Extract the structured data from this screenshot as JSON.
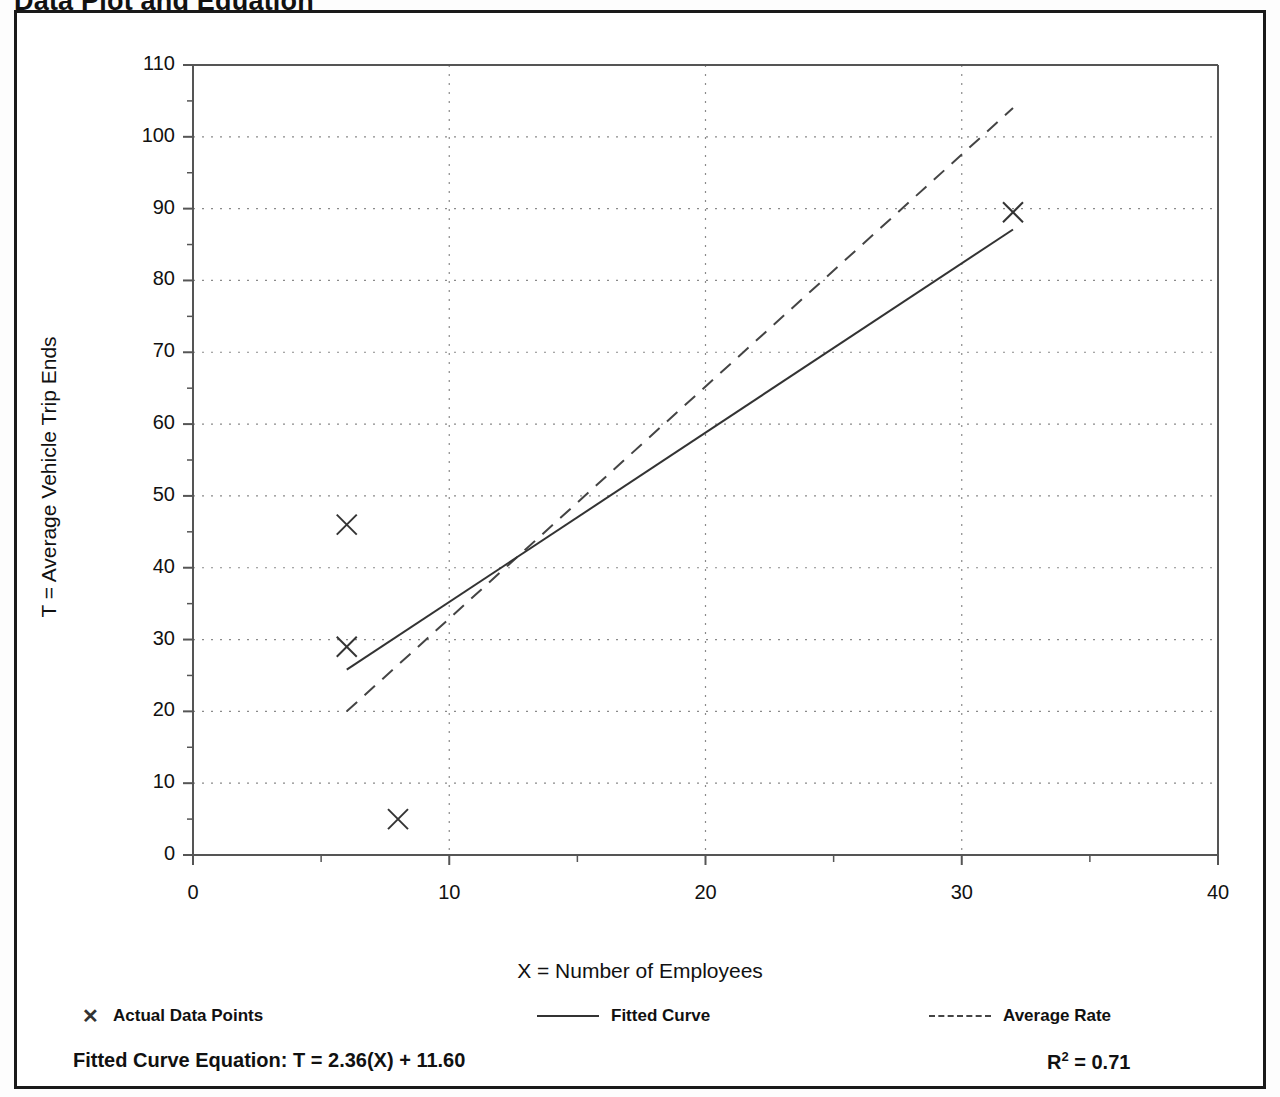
{
  "slide": {
    "title": "Data Plot and Equation"
  },
  "chart_data": {
    "type": "scatter",
    "title": "Data Plot and Equation",
    "xlabel": "X = Number of Employees",
    "ylabel": "T = Average Vehicle Trip Ends",
    "xlim": [
      0,
      40
    ],
    "ylim": [
      0,
      110
    ],
    "grid": true,
    "x_ticks": [
      0,
      10,
      20,
      30,
      40
    ],
    "x_tick_labels": [
      "0",
      "10",
      "20",
      "30",
      "40"
    ],
    "x_minor_tick_step": 5,
    "y_ticks": [
      0,
      10,
      20,
      30,
      40,
      50,
      60,
      70,
      80,
      90,
      100,
      110
    ],
    "y_tick_labels": [
      "0",
      "10",
      "20",
      "30",
      "40",
      "50",
      "60",
      "70",
      "80",
      "90",
      "100",
      "110"
    ],
    "y_minor_tick_step": 5,
    "legend_position": "bottom",
    "series": [
      {
        "name": "Actual Data Points",
        "type": "scatter",
        "marker": "x",
        "color": "#333333",
        "points": [
          {
            "x": 6,
            "y": 46
          },
          {
            "x": 6,
            "y": 29
          },
          {
            "x": 8,
            "y": 5
          },
          {
            "x": 32,
            "y": 89.5
          }
        ]
      },
      {
        "name": "Fitted Curve",
        "type": "line",
        "style": "solid",
        "color": "#333333",
        "equation": "T = 2.36(X) + 11.60",
        "slope": 2.36,
        "intercept": 11.6,
        "x_range": [
          6,
          32
        ],
        "endpoints": [
          {
            "x": 6,
            "y": 25.8
          },
          {
            "x": 32,
            "y": 87.1
          }
        ]
      },
      {
        "name": "Average Rate",
        "type": "line",
        "style": "dashed",
        "color": "#444444",
        "slope": 3.23,
        "intercept": 0.62,
        "x_range": [
          6,
          32
        ],
        "endpoints": [
          {
            "x": 6,
            "y": 20
          },
          {
            "x": 32,
            "y": 104
          }
        ]
      }
    ],
    "annotations": {
      "fitted_equation_label": "Fitted Curve Equation:",
      "fitted_equation_value": "T = 2.36(X) + 11.60",
      "r_squared_label": "R",
      "r_squared_exponent": "2",
      "r_squared_value": "= 0.71"
    }
  },
  "legend": {
    "items": [
      {
        "label": "Actual Data Points",
        "glyph": "x-marker-icon"
      },
      {
        "label": "Fitted Curve",
        "glyph": "solid-line-icon"
      },
      {
        "label": "Average Rate",
        "glyph": "dashed-line-icon"
      }
    ]
  },
  "axes": {
    "x_title": "X = Number of Employees",
    "y_title": "T = Average Vehicle Trip Ends"
  },
  "equation_row": {
    "fitted_text": "Fitted Curve Equation:  T = 2.36(X) + 11.60",
    "r_squared_prefix": "R",
    "r_squared_sup": "2",
    "r_squared_suffix": " = 0.71"
  },
  "colors": {
    "frame": "#1a1a1a",
    "axis": "#555555",
    "grid": "#8a8a8a",
    "series": "#333333",
    "text": "#111111"
  }
}
